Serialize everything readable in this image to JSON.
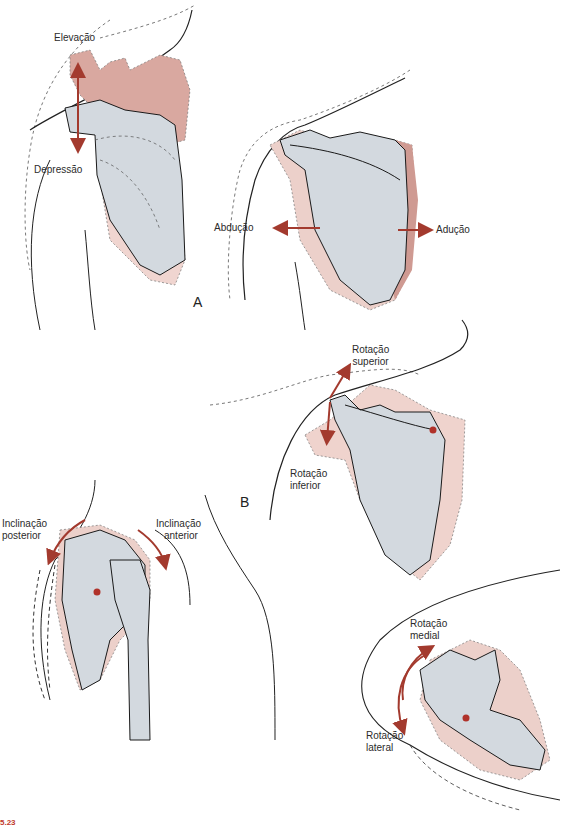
{
  "figure": {
    "panel_labels": {
      "a": "A",
      "b": "B"
    },
    "labels": {
      "elevation": "Elevação",
      "depression": "Depressão",
      "abduction": "Abdução",
      "adduction": "Adução",
      "upward_rotation": [
        "Rotação",
        "superior"
      ],
      "downward_rotation": [
        "Rotação",
        "inferior"
      ],
      "posterior_tilt": [
        "Inclinação",
        "posterior"
      ],
      "anterior_tilt": [
        "Inclinação",
        "anterior"
      ],
      "medial_rotation": [
        "Rotação",
        "medial"
      ],
      "lateral_rotation": [
        "Rotação",
        "lateral"
      ]
    },
    "caption": {
      "number": "5.23",
      "text": ""
    },
    "colors": {
      "arrow": "#a33a2e",
      "bone_fill": "#d3d9df",
      "displaced_fill": "#e9c3bd",
      "displaced_dark": "#cf9a92",
      "outline": "#1a1a1a",
      "pivot": "#b0322a"
    }
  }
}
